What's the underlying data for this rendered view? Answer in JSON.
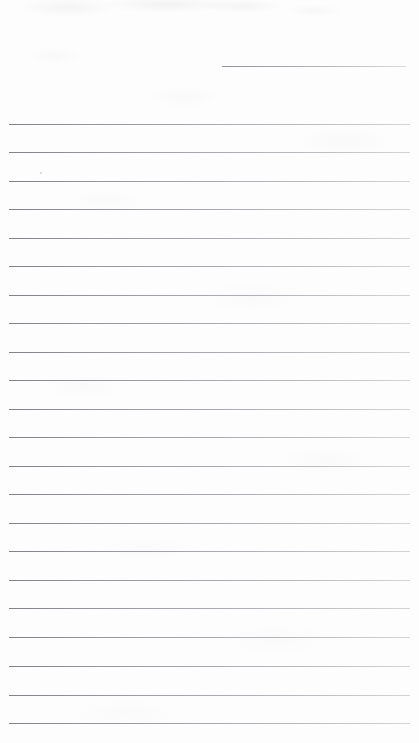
{
  "document": {
    "kind": "scanned-lined-paper",
    "title": "Blank ruled notepaper scan",
    "width_px": 419,
    "height_px": 743,
    "background_color": "#fdfdfd",
    "rule_color": "#8a8a8f",
    "text_content": "",
    "visible_text_count": 0,
    "note": "No legible handwriting or printed text is present; the page is blank apart from the ruled lines and faint scanner noise."
  },
  "rules": {
    "count": 23,
    "full_width_count": 22,
    "short_count": 1,
    "left_margin_px": 9,
    "right_edge_px": 410,
    "spacing_px": 28.5,
    "items": [
      {
        "id": "rule-header",
        "type": "short",
        "y": 66,
        "x_start": 222,
        "x_end": 406
      },
      {
        "id": "rule-1",
        "type": "full-width",
        "y": 124,
        "x_start": 9,
        "x_end": 410
      },
      {
        "id": "rule-2",
        "type": "full-width",
        "y": 152,
        "x_start": 9,
        "x_end": 410
      },
      {
        "id": "rule-3",
        "type": "full-width",
        "y": 181,
        "x_start": 9,
        "x_end": 410
      },
      {
        "id": "rule-4",
        "type": "full-width",
        "y": 209,
        "x_start": 9,
        "x_end": 410
      },
      {
        "id": "rule-5",
        "type": "full-width",
        "y": 238,
        "x_start": 9,
        "x_end": 410
      },
      {
        "id": "rule-6",
        "type": "full-width",
        "y": 266,
        "x_start": 9,
        "x_end": 410
      },
      {
        "id": "rule-7",
        "type": "full-width",
        "y": 295,
        "x_start": 9,
        "x_end": 410
      },
      {
        "id": "rule-8",
        "type": "full-width",
        "y": 323,
        "x_start": 9,
        "x_end": 410
      },
      {
        "id": "rule-9",
        "type": "full-width",
        "y": 352,
        "x_start": 9,
        "x_end": 410
      },
      {
        "id": "rule-10",
        "type": "full-width",
        "y": 380,
        "x_start": 9,
        "x_end": 410
      },
      {
        "id": "rule-11",
        "type": "full-width",
        "y": 409,
        "x_start": 9,
        "x_end": 410
      },
      {
        "id": "rule-12",
        "type": "full-width",
        "y": 437,
        "x_start": 9,
        "x_end": 410
      },
      {
        "id": "rule-13",
        "type": "full-width",
        "y": 466,
        "x_start": 9,
        "x_end": 410
      },
      {
        "id": "rule-14",
        "type": "full-width",
        "y": 494,
        "x_start": 9,
        "x_end": 410
      },
      {
        "id": "rule-15",
        "type": "full-width",
        "y": 523,
        "x_start": 9,
        "x_end": 410
      },
      {
        "id": "rule-16",
        "type": "full-width",
        "y": 551,
        "x_start": 9,
        "x_end": 410
      },
      {
        "id": "rule-17",
        "type": "full-width",
        "y": 580,
        "x_start": 9,
        "x_end": 410
      },
      {
        "id": "rule-18",
        "type": "full-width",
        "y": 608,
        "x_start": 9,
        "x_end": 410
      },
      {
        "id": "rule-19",
        "type": "full-width",
        "y": 637,
        "x_start": 9,
        "x_end": 410
      },
      {
        "id": "rule-20",
        "type": "full-width",
        "y": 666,
        "x_start": 9,
        "x_end": 410
      },
      {
        "id": "rule-21",
        "type": "full-width",
        "y": 695,
        "x_start": 9,
        "x_end": 410
      },
      {
        "id": "rule-22",
        "type": "full-width",
        "y": 723,
        "x_start": 9,
        "x_end": 410
      }
    ]
  },
  "artifacts": {
    "speck": {
      "x": 40,
      "y": 172
    }
  }
}
